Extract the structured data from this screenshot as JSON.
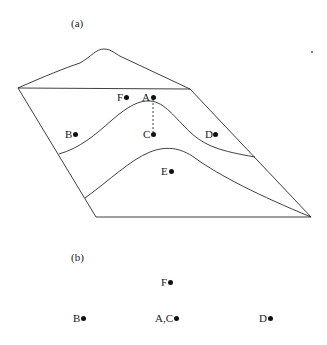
{
  "panel_a": {
    "label": "(a)",
    "points": [
      {
        "name": "A",
        "label": "A",
        "x": 153,
        "y": 97
      },
      {
        "name": "F",
        "label": "F",
        "x": 126,
        "y": 97
      },
      {
        "name": "B",
        "label": "B",
        "x": 75,
        "y": 134
      },
      {
        "name": "C",
        "label": "C",
        "x": 153,
        "y": 134
      },
      {
        "name": "D",
        "label": "D",
        "x": 215,
        "y": 134
      },
      {
        "name": "E",
        "label": "E",
        "x": 171,
        "y": 171
      }
    ]
  },
  "panel_b": {
    "label": "(b)",
    "points": [
      {
        "name": "F",
        "label": "F",
        "x": 170,
        "y": 282
      },
      {
        "name": "B",
        "label": "B",
        "x": 83,
        "y": 318
      },
      {
        "name": "AC",
        "label": "A,C",
        "x": 176,
        "y": 318
      },
      {
        "name": "D",
        "label": "D",
        "x": 270,
        "y": 318
      }
    ]
  },
  "colors": {
    "stroke": "#2a2a2a",
    "background": "#ffffff"
  }
}
